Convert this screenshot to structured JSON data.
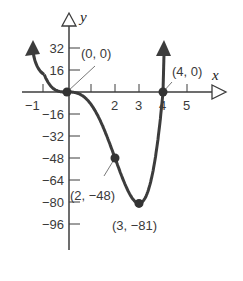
{
  "chart_data": {
    "type": "line",
    "title": "",
    "function": "f(x) = 3x^4 - 12x^3",
    "xlabel": "x",
    "ylabel": "y",
    "xlim": [
      -1.8,
      6.5
    ],
    "ylim": [
      -110,
      55
    ],
    "grid": false,
    "x_ticks": [
      {
        "value": -1,
        "label": "−1"
      },
      {
        "value": 1,
        "label": ""
      },
      {
        "value": 2,
        "label": "2"
      },
      {
        "value": 3,
        "label": "3"
      },
      {
        "value": 4,
        "label": "4"
      },
      {
        "value": 5,
        "label": "5"
      }
    ],
    "y_ticks": [
      {
        "value": 32,
        "label": "32"
      },
      {
        "value": 16,
        "label": "16"
      },
      {
        "value": -16,
        "label": "−16"
      },
      {
        "value": -32,
        "label": "−32"
      },
      {
        "value": -48,
        "label": "−48"
      },
      {
        "value": -64,
        "label": "−64"
      },
      {
        "value": -80,
        "label": "−80"
      },
      {
        "value": -96,
        "label": "−96"
      }
    ],
    "points": [
      {
        "x": 0,
        "y": 0,
        "label": "(0, 0)"
      },
      {
        "x": 4,
        "y": 0,
        "label": "(4, 0)"
      },
      {
        "x": 2,
        "y": -48,
        "label": "(2, −48)"
      },
      {
        "x": 3,
        "y": -81,
        "label": "(3, −81)"
      }
    ],
    "series": [
      {
        "name": "f",
        "x": [
          -1,
          -0.5,
          0,
          0.5,
          1,
          1.5,
          2,
          2.5,
          3,
          3.5,
          4,
          4.15
        ],
        "values": [
          15,
          1.7,
          0,
          -1.3,
          -9,
          -25.3,
          -48,
          -70.3,
          -81,
          -64.3,
          0,
          16.9
        ]
      }
    ]
  },
  "colors": {
    "curve": "#3c3c3c",
    "axis": "#3c3c3c",
    "text": "#3a3a3a"
  }
}
